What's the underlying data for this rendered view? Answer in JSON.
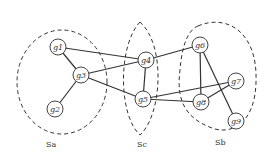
{
  "diagram": {
    "type": "graph",
    "nodes": [
      {
        "id": "g1",
        "label": "g1",
        "x": 58,
        "y": 47
      },
      {
        "id": "g2",
        "label": "g2",
        "x": 55,
        "y": 109
      },
      {
        "id": "g3",
        "label": "g3",
        "x": 81,
        "y": 75
      },
      {
        "id": "g4",
        "label": "g4",
        "x": 146,
        "y": 60
      },
      {
        "id": "g5",
        "label": "g5",
        "x": 143,
        "y": 99
      },
      {
        "id": "g6",
        "label": "g6",
        "x": 200,
        "y": 45
      },
      {
        "id": "g7",
        "label": "g7",
        "x": 236,
        "y": 81
      },
      {
        "id": "g8",
        "label": "g8",
        "x": 201,
        "y": 102
      },
      {
        "id": "g9",
        "label": "g9",
        "x": 236,
        "y": 121
      }
    ],
    "edges": [
      [
        "g1",
        "g3"
      ],
      [
        "g1",
        "g4"
      ],
      [
        "g3",
        "g2"
      ],
      [
        "g3",
        "g4"
      ],
      [
        "g3",
        "g5"
      ],
      [
        "g4",
        "g5"
      ],
      [
        "g4",
        "g6"
      ],
      [
        "g5",
        "g8"
      ],
      [
        "g5",
        "g7"
      ],
      [
        "g6",
        "g8"
      ],
      [
        "g6",
        "g9"
      ],
      [
        "g7",
        "g8"
      ]
    ],
    "sets": [
      {
        "id": "Sa",
        "label": "Sa",
        "label_x": 46,
        "label_y": 147
      },
      {
        "id": "Sc",
        "label": "Sc",
        "label_x": 137,
        "label_y": 147
      },
      {
        "id": "Sb",
        "label": "Sb",
        "label_x": 215,
        "label_y": 145
      }
    ]
  }
}
